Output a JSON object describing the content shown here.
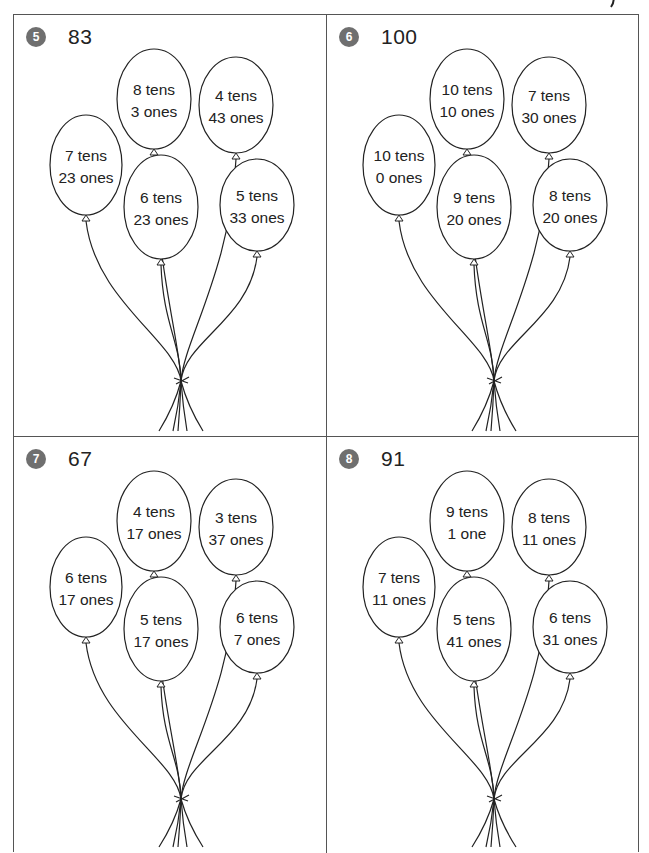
{
  "problems": [
    {
      "number": "5",
      "target": "83",
      "balloons": [
        {
          "tens": "7 tens",
          "ones": "23 ones"
        },
        {
          "tens": "8 tens",
          "ones": "3 ones"
        },
        {
          "tens": "4 tens",
          "ones": "43 ones"
        },
        {
          "tens": "6 tens",
          "ones": "23 ones"
        },
        {
          "tens": "5 tens",
          "ones": "33 ones"
        }
      ]
    },
    {
      "number": "6",
      "target": "100",
      "balloons": [
        {
          "tens": "10 tens",
          "ones": "0 ones"
        },
        {
          "tens": "10 tens",
          "ones": "10 ones"
        },
        {
          "tens": "7 tens",
          "ones": "30 ones"
        },
        {
          "tens": "9 tens",
          "ones": "20 ones"
        },
        {
          "tens": "8 tens",
          "ones": "20 ones"
        }
      ]
    },
    {
      "number": "7",
      "target": "67",
      "balloons": [
        {
          "tens": "6 tens",
          "ones": "17 ones"
        },
        {
          "tens": "4 tens",
          "ones": "17 ones"
        },
        {
          "tens": "3 tens",
          "ones": "37 ones"
        },
        {
          "tens": "5 tens",
          "ones": "17 ones"
        },
        {
          "tens": "6 tens",
          "ones": "7 ones"
        }
      ]
    },
    {
      "number": "8",
      "target": "91",
      "balloons": [
        {
          "tens": "7 tens",
          "ones": "11 ones"
        },
        {
          "tens": "9 tens",
          "ones": "1 one"
        },
        {
          "tens": "8 tens",
          "ones": "11 ones"
        },
        {
          "tens": "5 tens",
          "ones": "41 ones"
        },
        {
          "tens": "6 tens",
          "ones": "31 ones"
        }
      ]
    }
  ],
  "colors": {
    "badge": "#6f6f6f",
    "line": "#222222",
    "border": "#555555"
  }
}
